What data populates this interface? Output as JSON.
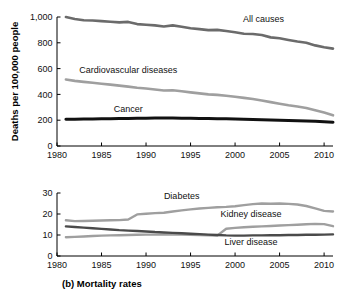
{
  "figure": {
    "caption": "(b) Mortality rates"
  },
  "chart_data": [
    {
      "type": "line",
      "id": "top-panel",
      "title": "",
      "xlabel": "",
      "ylabel": "Deaths per 100,000 people",
      "xlim": [
        1980,
        2011
      ],
      "ylim": [
        0,
        1000
      ],
      "xticks": [
        1980,
        1985,
        1990,
        1995,
        2000,
        2005,
        2010
      ],
      "xticklabels": [
        "1980",
        "1985",
        "1990",
        "1995",
        "2000",
        "2005",
        "2010"
      ],
      "yticks": [
        0,
        200,
        400,
        600,
        800,
        1000
      ],
      "yticklabels": [
        "0",
        "200",
        "400",
        "600",
        "800",
        "1,000"
      ],
      "grid": false,
      "legend": "inline-annotations",
      "x": [
        1981,
        1982,
        1983,
        1984,
        1985,
        1986,
        1987,
        1988,
        1989,
        1990,
        1991,
        1992,
        1993,
        1994,
        1995,
        1996,
        1997,
        1998,
        1999,
        2000,
        2001,
        2002,
        2003,
        2004,
        2005,
        2006,
        2007,
        2008,
        2009,
        2010,
        2011
      ],
      "series": [
        {
          "name": "All causes",
          "color": "#6b6b6b",
          "width": 2.6,
          "label_x": 2003.2,
          "label_y": 960,
          "values": [
            1000,
            985,
            975,
            973,
            968,
            963,
            958,
            962,
            945,
            940,
            935,
            927,
            935,
            925,
            913,
            906,
            898,
            900,
            892,
            882,
            870,
            868,
            860,
            842,
            835,
            822,
            810,
            800,
            780,
            765,
            755
          ]
        },
        {
          "name": "Cardiovascular diseases",
          "color": "#9f9f9f",
          "width": 2.6,
          "label_x": 1988.0,
          "label_y": 565,
          "values": [
            515,
            505,
            497,
            490,
            483,
            476,
            468,
            460,
            452,
            446,
            438,
            430,
            432,
            424,
            416,
            408,
            400,
            396,
            390,
            382,
            373,
            364,
            352,
            340,
            328,
            316,
            306,
            295,
            278,
            260,
            238
          ]
        },
        {
          "name": "Cancer",
          "color": "#111111",
          "width": 3.0,
          "label_x": 1988.0,
          "label_y": 262,
          "values": [
            207,
            208,
            209,
            210,
            211,
            212,
            213,
            214,
            215,
            216,
            217,
            217,
            217,
            216,
            215,
            214,
            213,
            212,
            211,
            210,
            208,
            206,
            204,
            202,
            200,
            198,
            196,
            194,
            191,
            188,
            185
          ]
        }
      ]
    },
    {
      "type": "line",
      "id": "bottom-panel",
      "title": "",
      "xlabel": "",
      "ylabel": "",
      "xlim": [
        1980,
        2011
      ],
      "ylim": [
        0,
        30
      ],
      "xticks": [
        1980,
        1985,
        1990,
        1995,
        2000,
        2005,
        2010
      ],
      "xticklabels": [
        "1980",
        "1985",
        "1990",
        "1995",
        "2000",
        "2005",
        "2010"
      ],
      "yticks": [
        0,
        10,
        20,
        30
      ],
      "yticklabels": [
        "0",
        "10",
        "20",
        "30"
      ],
      "grid": false,
      "legend": "inline-annotations",
      "x": [
        1981,
        1982,
        1983,
        1984,
        1985,
        1986,
        1987,
        1988,
        1989,
        1990,
        1991,
        1992,
        1993,
        1994,
        1995,
        1996,
        1997,
        1998,
        1999,
        2000,
        2001,
        2002,
        2003,
        2004,
        2005,
        2006,
        2007,
        2008,
        2009,
        2010,
        2011
      ],
      "series": [
        {
          "name": "Diabetes",
          "color": "#9f9f9f",
          "width": 2.4,
          "label_x": 1994.0,
          "label_y": 27.3,
          "values": [
            17.0,
            16.6,
            16.7,
            16.8,
            16.9,
            17.0,
            17.1,
            17.4,
            19.8,
            20.1,
            20.4,
            20.6,
            21.2,
            21.7,
            22.2,
            22.6,
            22.9,
            23.2,
            23.4,
            23.7,
            24.2,
            24.7,
            25.0,
            24.9,
            25.0,
            24.8,
            24.5,
            23.8,
            22.7,
            21.5,
            21.2
          ]
        },
        {
          "name": "Kidney disease",
          "color": "#9f9f9f",
          "width": 2.4,
          "label_x": 2001.8,
          "label_y": 18.5,
          "values": [
            8.9,
            9.1,
            9.3,
            9.5,
            9.7,
            9.8,
            9.9,
            10.0,
            10.1,
            10.2,
            10.2,
            10.2,
            10.2,
            10.2,
            10.1,
            10.0,
            9.9,
            9.7,
            13.0,
            13.4,
            13.7,
            13.9,
            14.1,
            14.3,
            14.5,
            14.7,
            14.9,
            15.1,
            15.3,
            15.2,
            14.2
          ]
        },
        {
          "name": "Liver disease",
          "color": "#4a4a4a",
          "width": 2.4,
          "label_x": 2001.8,
          "label_y": 5.2,
          "values": [
            14.1,
            13.8,
            13.5,
            13.2,
            12.9,
            12.6,
            12.3,
            12.1,
            11.9,
            11.7,
            11.4,
            11.2,
            11.0,
            10.8,
            10.6,
            10.4,
            10.2,
            10.0,
            9.8,
            9.7,
            9.7,
            9.8,
            9.8,
            9.9,
            9.9,
            10.0,
            10.0,
            10.1,
            10.1,
            10.2,
            10.3
          ]
        }
      ]
    }
  ]
}
